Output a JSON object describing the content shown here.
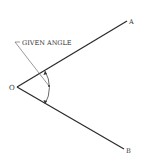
{
  "diagram": {
    "title_fragment": "",
    "vertex_label": "O",
    "ray_a_label": "A",
    "ray_b_label": "B",
    "annotation": "GIVEN ANGLE",
    "colors": {
      "line": "#2a2a2a",
      "thin": "#555555",
      "text": "#333333"
    }
  }
}
